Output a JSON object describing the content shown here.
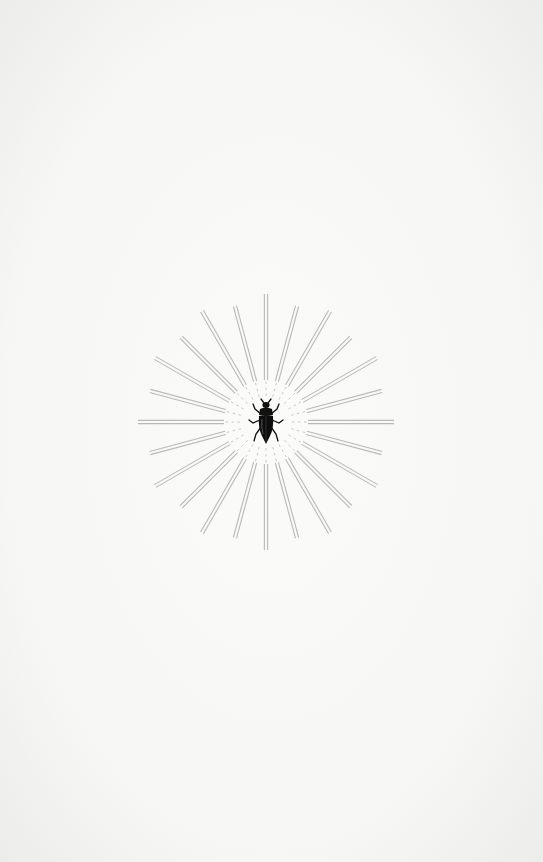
{
  "page": {
    "type": "scanned book page",
    "background_color": "#f6f6f4"
  },
  "illustration": {
    "name": "sunburst-with-beetle",
    "center": [
      266,
      422
    ],
    "ray_count": 24,
    "ray_color": "#b9b9b9",
    "inner_radius": 38,
    "long_ray_length": 128,
    "short_ray_length": 120,
    "subject": "beetle-icon",
    "subject_color": "#111111"
  },
  "bleed_through_text": ""
}
